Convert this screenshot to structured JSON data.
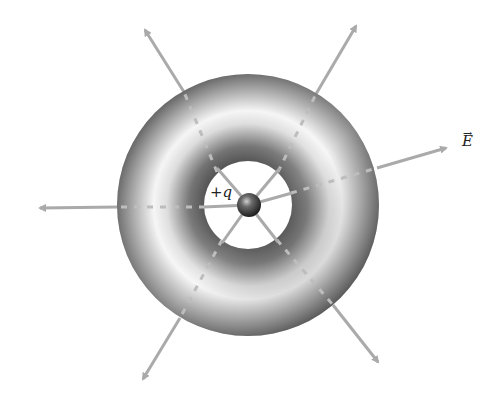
{
  "diagram": {
    "charge": {
      "label_sign": "+",
      "label_symbol": "q",
      "center": [
        249,
        205
      ],
      "radius": 12,
      "color": "#444444"
    },
    "torus": {
      "center": [
        248,
        205
      ],
      "outer_radius": 131,
      "inner_radius": 44,
      "shade_dark": "#3a3a3a",
      "shade_light": "#f2f2f2"
    },
    "field_label": {
      "vector_mark": "→",
      "symbol": "E"
    },
    "arrows": [
      {
        "name": "field-line-upper-left",
        "tip": [
          142,
          25
        ]
      },
      {
        "name": "field-line-upper-right",
        "tip": [
          360,
          20
        ]
      },
      {
        "name": "field-line-right",
        "tip": [
          452,
          146
        ]
      },
      {
        "name": "field-line-left",
        "tip": [
          33,
          208
        ]
      },
      {
        "name": "field-line-lower-left",
        "tip": [
          140,
          385
        ]
      },
      {
        "name": "field-line-lower-right",
        "tip": [
          383,
          367
        ]
      }
    ],
    "line_color": "#aaaaaa"
  }
}
